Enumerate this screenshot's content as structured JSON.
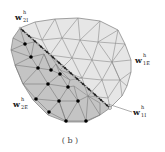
{
  "figure": {
    "caption": "( b )",
    "colors": {
      "domain_1_fill": "#e6e6e6",
      "domain_2_fill": "#c4c4c4",
      "mesh_line": "#8a8a8a",
      "interior_node": "#000000",
      "interface_bead_light": "#ffffff",
      "interface_bead_dark": "#111111"
    },
    "labels": [
      {
        "id": "w2I",
        "base": "w",
        "sup": "h",
        "sub": "2I",
        "x": 15,
        "y": 20
      },
      {
        "id": "w1E",
        "base": "w",
        "sup": "h",
        "sub": "1E",
        "x": 135,
        "y": 63
      },
      {
        "id": "w2E",
        "base": "w",
        "sup": "h",
        "sub": "2E",
        "x": 13,
        "y": 107
      },
      {
        "id": "w1I",
        "base": "w",
        "sup": "h",
        "sub": "1I",
        "x": 133,
        "y": 115
      }
    ],
    "domain_1_outline": "20,28 35,22 55,19 78,18 100,21 118,30 125,44 131,60 131,72 127,86 122,96 110,108",
    "domain_2_outline": "20,28 13,38 11,50 15,65 23,84 33,100 48,115 66,122 86,122 100,115 110,108",
    "interface": {
      "x1": 20,
      "y1": 28,
      "x2": 110,
      "y2": 108
    },
    "interior_nodes": [
      [
        25,
        44
      ],
      [
        31,
        57
      ],
      [
        38,
        68
      ],
      [
        51,
        70
      ],
      [
        60,
        74
      ],
      [
        48,
        84
      ],
      [
        68,
        87
      ],
      [
        36,
        99
      ],
      [
        59,
        101
      ],
      [
        78,
        101
      ],
      [
        49,
        112
      ],
      [
        66,
        121
      ],
      [
        86,
        121
      ]
    ]
  }
}
